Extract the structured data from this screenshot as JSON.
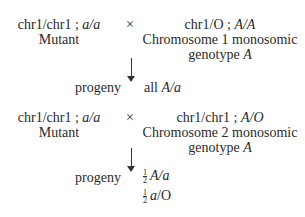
{
  "cross1": {
    "parent1_genotype_prefix": "chr1/chr1 ; ",
    "parent1_allele": "a/a",
    "parent1_label": "Mutant",
    "cross_symbol": "×",
    "parent2_genotype_prefix": "chr1/O ; ",
    "parent2_allele": "A/A",
    "parent2_label_line1": "Chromosome 1 monosomic",
    "parent2_label_line2_prefix": "genotype ",
    "parent2_label_line2_allele": "A",
    "progeny_label": "progeny",
    "progeny_prefix": "all ",
    "progeny_allele": "A/a"
  },
  "cross2": {
    "parent1_genotype_prefix": "chr1/chr1 ; ",
    "parent1_allele": "a/a",
    "parent1_label": "Mutant",
    "cross_symbol": "×",
    "parent2_genotype_prefix": "chr1/chr1 ; ",
    "parent2_allele": "A/O",
    "parent2_label_line1": "Chromosome 2 monosomic",
    "parent2_label_line2_prefix": "genotype ",
    "parent2_label_line2_allele": "A",
    "progeny_label": "progeny",
    "progeny": [
      {
        "num": "1",
        "den": "2",
        "genotype": "A/a"
      },
      {
        "num": "1",
        "den": "2",
        "genotype": "a/O"
      }
    ]
  }
}
